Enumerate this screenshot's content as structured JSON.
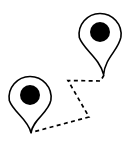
{
  "canvas": {
    "width": 127,
    "height": 143,
    "background_color": "#ffffff",
    "title": "Two map location pins connected by a dashed route"
  },
  "style": {
    "stroke_color": "#000000",
    "fill_color": "#ffffff",
    "dot_color": "#000000",
    "outline_width": 1.6,
    "route_width": 1.7,
    "dash_pattern": "4 3.4"
  },
  "markers": [
    {
      "id": "marker-top-right",
      "label": "",
      "head_center_x": 100,
      "head_center_y": 32,
      "head_radius": 21,
      "dot_radius": 10,
      "tip_x": 104,
      "tip_y": 75,
      "path": "M 100 11 A 21 21 0 1 0 100 53 A 21 21 0 1 0 100 11 Z",
      "shape_path": "M 79.3 37.5 C 83.5 49.5 99.5 58 103.6 74.6 C 105 58 118.6 50 120.9 37.2 A 21 21 0 1 0 79.3 37.5 Z"
    },
    {
      "id": "marker-bottom-left",
      "label": "",
      "head_center_x": 30,
      "head_center_y": 95,
      "head_radius": 21,
      "dot_radius": 10,
      "tip_x": 31,
      "tip_y": 133,
      "path": "M 30 74 A 21 21 0 1 0 30 116 A 21 21 0 1 0 30 74 Z",
      "shape_path": "M 9.3 100.5 C 13.5 112.5 28 119 31 132.8 C 33 119 48.6 113 50.9 100.2 A 21 21 0 1 0 9.3 100.5 Z"
    }
  ],
  "route": {
    "id": "dashed-route",
    "style": "dashed",
    "points": [
      {
        "x": 104,
        "y": 75
      },
      {
        "x": 100.5,
        "y": 81
      },
      {
        "x": 68,
        "y": 80.5
      },
      {
        "x": 89,
        "y": 117
      },
      {
        "x": 31,
        "y": 132.5
      }
    ],
    "path": "M 104 75 L 100.5 81 L 68 80.5 L 89 117 L 31 132.5"
  }
}
